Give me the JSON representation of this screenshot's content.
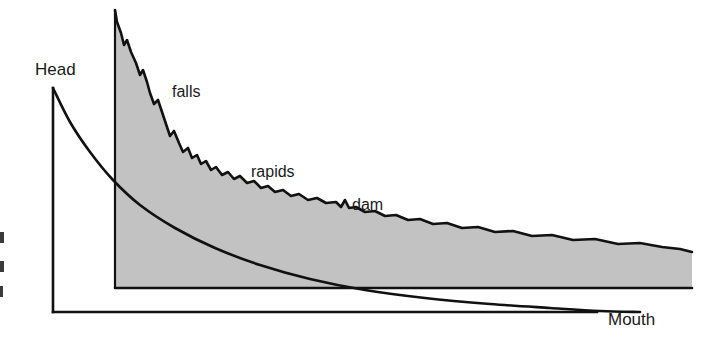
{
  "figure": {
    "name": "river-longitudinal-profile",
    "background_color": "#ffffff",
    "line_color": "#111111",
    "fill_color": "#c2c2c2"
  },
  "labels": {
    "head": "Head",
    "falls": "falls",
    "rapids": "rapids",
    "dam": "dam",
    "mouth": "Mouth"
  },
  "axes": {
    "vertical_axis_name": "elevation-axis",
    "horizontal_axis_name": "distance-axis",
    "arrow_direction": "right"
  },
  "chart_data": {
    "type": "area",
    "title": "",
    "xlabel": "Mouth",
    "ylabel": "Head",
    "grid": false,
    "legend": "none",
    "annotations": [
      {
        "text": "Head",
        "x": 35,
        "y": 75
      },
      {
        "text": "falls",
        "x": 172,
        "y": 97
      },
      {
        "text": "rapids",
        "x": 251,
        "y": 177
      },
      {
        "text": "dam",
        "x": 352,
        "y": 210
      },
      {
        "text": "Mouth",
        "x": 608,
        "y": 325
      }
    ],
    "series": [
      {
        "name": "river-long-profile",
        "kind": "filled-stepped-profile",
        "baseline_y": 288,
        "points": [
          [
            115,
            10
          ],
          [
            117,
            22
          ],
          [
            121,
            33
          ],
          [
            124,
            45
          ],
          [
            127,
            40
          ],
          [
            131,
            52
          ],
          [
            136,
            63
          ],
          [
            140,
            75
          ],
          [
            143,
            70
          ],
          [
            147,
            82
          ],
          [
            150,
            93
          ],
          [
            154,
            104
          ],
          [
            158,
            100
          ],
          [
            162,
            112
          ],
          [
            166,
            124
          ],
          [
            170,
            136
          ],
          [
            174,
            131
          ],
          [
            179,
            143
          ],
          [
            183,
            152
          ],
          [
            188,
            148
          ],
          [
            192,
            158
          ],
          [
            197,
            155
          ],
          [
            201,
            164
          ],
          [
            206,
            161
          ],
          [
            211,
            170
          ],
          [
            216,
            167
          ],
          [
            222,
            175
          ],
          [
            228,
            172
          ],
          [
            234,
            179
          ],
          [
            240,
            176
          ],
          [
            247,
            183
          ],
          [
            254,
            181
          ],
          [
            261,
            188
          ],
          [
            268,
            186
          ],
          [
            275,
            192
          ],
          [
            283,
            190
          ],
          [
            291,
            196
          ],
          [
            299,
            194
          ],
          [
            308,
            200
          ],
          [
            317,
            198
          ],
          [
            326,
            203
          ],
          [
            336,
            202
          ],
          [
            341,
            207
          ],
          [
            345,
            200
          ],
          [
            349,
            208
          ],
          [
            356,
            207
          ],
          [
            365,
            212
          ],
          [
            375,
            211
          ],
          [
            385,
            216
          ],
          [
            396,
            215
          ],
          [
            408,
            220
          ],
          [
            420,
            219
          ],
          [
            433,
            224
          ],
          [
            447,
            223
          ],
          [
            462,
            228
          ],
          [
            478,
            227
          ],
          [
            495,
            232
          ],
          [
            513,
            231
          ],
          [
            532,
            236
          ],
          [
            552,
            235
          ],
          [
            573,
            240
          ],
          [
            595,
            239
          ],
          [
            618,
            244
          ],
          [
            640,
            243
          ],
          [
            662,
            247
          ],
          [
            680,
            249
          ],
          [
            692,
            252
          ]
        ]
      },
      {
        "name": "head-decay-curve",
        "kind": "smooth-curve",
        "points": [
          [
            53,
            88
          ],
          [
            70,
            122
          ],
          [
            90,
            152
          ],
          [
            113,
            180
          ],
          [
            140,
            205
          ],
          [
            175,
            228
          ],
          [
            215,
            248
          ],
          [
            260,
            265
          ],
          [
            310,
            279
          ],
          [
            365,
            290
          ],
          [
            425,
            298
          ],
          [
            490,
            304
          ],
          [
            550,
            308
          ],
          [
            600,
            311
          ],
          [
            640,
            312
          ]
        ]
      }
    ],
    "axis_lines": [
      {
        "name": "vertical-axis",
        "x1": 53,
        "y1": 88,
        "x2": 53,
        "y2": 312
      },
      {
        "name": "horizontal-axis",
        "x1": 53,
        "y1": 312,
        "x2": 597,
        "y2": 312
      }
    ]
  },
  "edge_marks": {
    "description": "three partial glyph fragments clipped at left edge",
    "count": 3
  }
}
